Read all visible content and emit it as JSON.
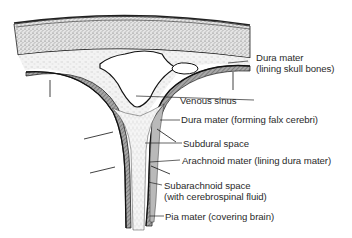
{
  "diagram": {
    "labels": {
      "dura_skull": {
        "line1": "Dura mater",
        "line2": "(lining skull bones)"
      },
      "venous_sinus": "Venous sinus",
      "dura_falx": "Dura mater (forming falx cerebri)",
      "subdural": "Subdural space",
      "arachnoid": "Arachnoid mater (lining dura mater)",
      "subarachnoid": {
        "line1": "Subarachnoid space",
        "line2": "(with cerebrospinal fluid)"
      },
      "pia": "Pia mater (covering brain)"
    },
    "colors": {
      "ink": "#1a1a1a",
      "bone_stipple": "#d9d9d9",
      "dura": "#f4f4f4",
      "arachnoid_band": "#9a9a9a",
      "subarachnoid": "#bdbdbd",
      "background": "#ffffff"
    }
  }
}
